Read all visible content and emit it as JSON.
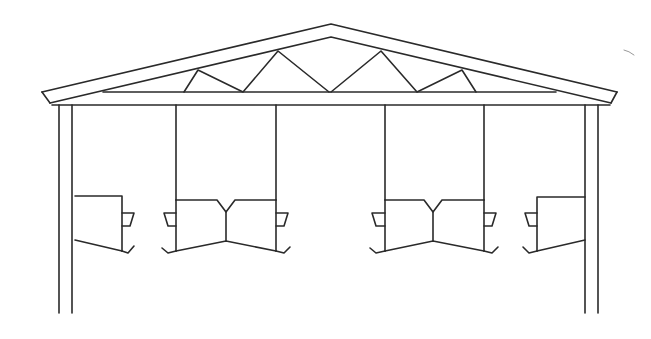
{
  "diagram": {
    "title": "Open-sided livestock shelter cross-section with roof truss and feeding troughs",
    "stroke_color": "#2a2a2a",
    "background_color": "#ffffff",
    "components": {
      "roof": "pitched-roof",
      "truss": "web-truss",
      "beam": "tie-beam",
      "posts": [
        "outer-left-post",
        "outer-right-post"
      ],
      "hangers": [
        "hanger-1",
        "hanger-2",
        "hanger-3",
        "hanger-4"
      ],
      "troughs": [
        "trough-left-single",
        "trough-left-double",
        "trough-right-double",
        "trough-right-single"
      ]
    }
  }
}
